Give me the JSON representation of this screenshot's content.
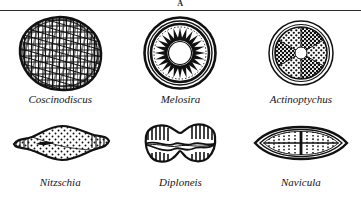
{
  "plate": {
    "letter": "A",
    "background_color": "#ffffff",
    "ink_color": "#111111",
    "rule_color": "#2b2b2b"
  },
  "specimens": [
    {
      "name": "Coscinodiscus",
      "shape": "circular valve with dense polygonal areolae mesh",
      "icon": "diatom-coscinodiscus-icon",
      "row": 1,
      "column": 1
    },
    {
      "name": "Melosira",
      "shape": "circular valve with radial wedge spokes and concentric rings around a clear centre",
      "icon": "diatom-melosira-icon",
      "row": 1,
      "column": 2
    },
    {
      "name": "Actinoptychus",
      "shape": "circular valve with outer ring and alternating stippled sectors",
      "icon": "diatom-actinoptychus-icon",
      "row": 1,
      "column": 3
    },
    {
      "name": "Nitzschia",
      "shape": "lens shaped valve with stippled interior and pointed apices",
      "icon": "diatom-nitzschia-icon",
      "row": 2,
      "column": 1
    },
    {
      "name": "Diploneis",
      "shape": "waisted peanut shaped valve with striated ends",
      "icon": "diatom-diploneis-icon",
      "row": 2,
      "column": 2
    },
    {
      "name": "Navicula",
      "shape": "boat shaped valve with central raphe and transverse striae",
      "icon": "diatom-navicula-icon",
      "row": 2,
      "column": 3
    }
  ]
}
